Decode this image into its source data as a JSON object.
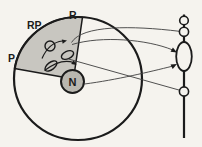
{
  "figure": {
    "alt": "Diagram of an atom with shaded sector RP, nucleus N and electrons, imaged through a lens onto points along a vertical optical axis",
    "labels": {
      "sector": "RP",
      "top_radius": "R",
      "left_radius": "P",
      "nucleus": "N"
    },
    "colors": {
      "paper": "#f5f3ee",
      "ink": "#1b1b1b",
      "sector_fill": "#c8c6c0",
      "nucleus_fill": "#b9b7b0",
      "ray": "#3d3d3d"
    }
  }
}
